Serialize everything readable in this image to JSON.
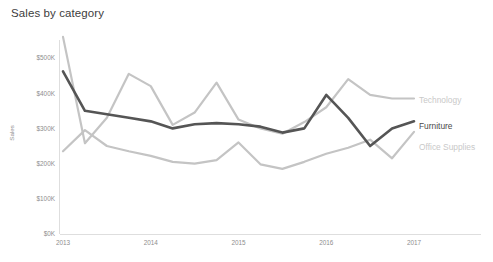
{
  "chart": {
    "title": "Sales by category",
    "background_color": "#ffffff",
    "title_color": "#3d3d3d"
  },
  "axes": {
    "y_axis_title": "Sales",
    "y_ticks": [
      "$0K",
      "$100K",
      "$200K",
      "$300K",
      "$400K",
      "$500K"
    ],
    "x_ticks": [
      "2013",
      "2014",
      "2015",
      "2016",
      "2017"
    ],
    "tick_color": "#8e8e8e",
    "axis_line_color": "#dedede"
  },
  "series_labels": {
    "technology": "Technology",
    "furniture": "Furniture",
    "office_supplies": "Office Supplies"
  },
  "chart_data": {
    "type": "line",
    "title": "Sales by category",
    "xlabel": "",
    "ylabel": "Sales",
    "xlim": [
      2013.0,
      2017.0
    ],
    "ylim": [
      0,
      500000
    ],
    "y_tick_values": [
      0,
      100000,
      200000,
      300000,
      400000,
      500000
    ],
    "y_tick_labels": [
      "$0K",
      "$100K",
      "$200K",
      "$300K",
      "$400K",
      "$500K"
    ],
    "x_tick_values": [
      2013,
      2014,
      2015,
      2016,
      2017
    ],
    "x_tick_labels": [
      "2013",
      "2014",
      "2015",
      "2016",
      "2017"
    ],
    "x_unit": "quarter",
    "grid": false,
    "legend": "inline-right-end-labels",
    "x": [
      2013.0,
      2013.25,
      2013.5,
      2013.75,
      2014.0,
      2014.25,
      2014.5,
      2014.75,
      2015.0,
      2015.25,
      2015.5,
      2015.75,
      2016.0,
      2016.25,
      2016.5,
      2016.75,
      2017.0
    ],
    "series": [
      {
        "name": "Technology",
        "color": "#c4c4c4",
        "stroke_width": 2.2,
        "label_color": "#c9c9c9",
        "values": [
          560000,
          258000,
          330000,
          455000,
          420000,
          310000,
          345000,
          430000,
          325000,
          300000,
          285000,
          318000,
          360000,
          440000,
          395000,
          385000,
          385000
        ]
      },
      {
        "name": "Furniture",
        "color": "#555555",
        "stroke_width": 2.6,
        "label_color": "#4a4a4a",
        "values": [
          462000,
          350000,
          340000,
          330000,
          320000,
          300000,
          312000,
          315000,
          312000,
          305000,
          288000,
          300000,
          395000,
          330000,
          250000,
          300000,
          320000
        ]
      },
      {
        "name": "Office Supplies",
        "color": "#c4c4c4",
        "stroke_width": 2.2,
        "label_color": "#c9c9c9",
        "values": [
          235000,
          295000,
          250000,
          235000,
          222000,
          205000,
          200000,
          210000,
          260000,
          198000,
          185000,
          205000,
          228000,
          245000,
          268000,
          215000,
          290000
        ]
      }
    ]
  }
}
